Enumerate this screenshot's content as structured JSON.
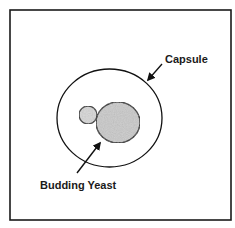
{
  "diagram": {
    "type": "labeled-illustration",
    "frame": {
      "x": 10,
      "y": 10,
      "width": 221,
      "height": 210,
      "stroke": "#1a1a1a",
      "stroke_width": 1.6
    },
    "shapes": {
      "capsule": {
        "cx": 109.5,
        "cy": 118,
        "rx": 52.5,
        "ry": 49,
        "fill": "none",
        "stroke": "#111111"
      },
      "mother_cell": {
        "cx": 118,
        "cy": 122.5,
        "rx": 22,
        "ry": 20.5,
        "fill": "#c9c9c9",
        "stroke": "#111111"
      },
      "bud": {
        "cx": 88,
        "cy": 115,
        "r": 9,
        "fill": "#d6d6d6",
        "stroke": "#111111"
      }
    },
    "labels": [
      {
        "id": "capsule",
        "text": "Capsule",
        "x": 165,
        "y": 63,
        "arrow": {
          "from": [
            162,
            64
          ],
          "to": [
            148,
            80
          ]
        }
      },
      {
        "id": "budding-yeast",
        "text": "Budding Yeast",
        "x": 40,
        "y": 189,
        "arrow": {
          "from": [
            77,
            173
          ],
          "to": [
            100,
            143
          ]
        }
      }
    ],
    "colors": {
      "ink": "#111111",
      "cell_fill": "#c9c9c9",
      "background": "#ffffff"
    }
  }
}
